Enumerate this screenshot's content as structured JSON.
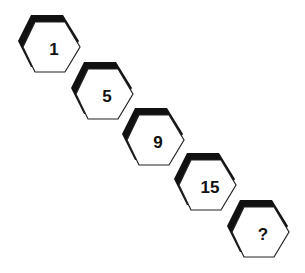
{
  "puzzle": {
    "description": "Number sequence in hexagons arranged diagonally",
    "hexagons": [
      {
        "label": "1",
        "x": 18,
        "y": 13
      },
      {
        "label": "5",
        "x": 71,
        "y": 60
      },
      {
        "label": "9",
        "x": 122,
        "y": 106
      },
      {
        "label": "15",
        "x": 174,
        "y": 151
      },
      {
        "label": "?",
        "x": 227,
        "y": 198
      }
    ],
    "colors": {
      "shadow": "#111111",
      "fill": "#ffffff",
      "stroke": "#222222",
      "text": "#111111"
    }
  }
}
